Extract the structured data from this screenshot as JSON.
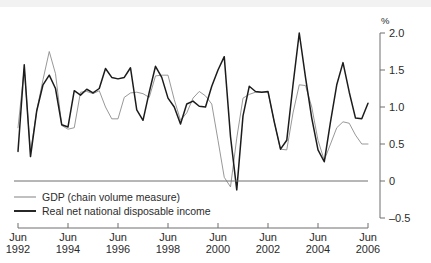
{
  "chart_data": {
    "type": "line",
    "title": "",
    "subtitle": "",
    "xlabel": "",
    "ylabel": "",
    "unit_label": "%",
    "ylim": [
      -0.5,
      2.0
    ],
    "yticks": [
      2.0,
      1.5,
      1.0,
      0.5,
      0.0,
      -0.5
    ],
    "ytick_labels": [
      "2.0",
      "1.5",
      "1.0",
      "0.5",
      "0",
      "–0.5"
    ],
    "grid": false,
    "legend_position": "bottom-left",
    "zero_line": true,
    "x_axis": {
      "frequency": "quarterly",
      "start": "Jun 1992",
      "end": "Jun 2006",
      "tick_labels": [
        {
          "month": "Jun",
          "year": "1992"
        },
        {
          "month": "Jun",
          "year": "1994"
        },
        {
          "month": "Jun",
          "year": "1996"
        },
        {
          "month": "Jun",
          "year": "1998"
        },
        {
          "month": "Jun",
          "year": "2000"
        },
        {
          "month": "Jun",
          "year": "2002"
        },
        {
          "month": "Jun",
          "year": "2004"
        },
        {
          "month": "Jun",
          "year": "2006"
        }
      ],
      "tick_years": [
        1992,
        1994,
        1996,
        1998,
        2000,
        2002,
        2004,
        2006
      ]
    },
    "x": [
      "Jun 1992",
      "Sep 1992",
      "Dec 1992",
      "Mar 1993",
      "Jun 1993",
      "Sep 1993",
      "Dec 1993",
      "Mar 1994",
      "Jun 1994",
      "Sep 1994",
      "Dec 1994",
      "Mar 1995",
      "Jun 1995",
      "Sep 1995",
      "Dec 1995",
      "Mar 1996",
      "Jun 1996",
      "Sep 1996",
      "Dec 1996",
      "Mar 1997",
      "Jun 1997",
      "Sep 1997",
      "Dec 1997",
      "Mar 1998",
      "Jun 1998",
      "Sep 1998",
      "Dec 1998",
      "Mar 1999",
      "Jun 1999",
      "Sep 1999",
      "Dec 1999",
      "Mar 2000",
      "Jun 2000",
      "Sep 2000",
      "Dec 2000",
      "Mar 2001",
      "Jun 2001",
      "Sep 2001",
      "Dec 2001",
      "Mar 2002",
      "Jun 2002",
      "Sep 2002",
      "Dec 2002",
      "Mar 2003",
      "Jun 2003",
      "Sep 2003",
      "Dec 2003",
      "Mar 2004",
      "Jun 2004",
      "Sep 2004",
      "Dec 2004",
      "Mar 2005",
      "Jun 2005",
      "Sep 2005",
      "Dec 2005",
      "Mar 2006",
      "Jun 2006"
    ],
    "series": [
      {
        "name": "GDP (chain volume measure)",
        "color": "#8c8c8c",
        "width": "thin",
        "values": [
          0.72,
          1.52,
          0.39,
          0.95,
          1.37,
          1.75,
          1.45,
          0.75,
          0.7,
          0.72,
          1.2,
          1.21,
          1.18,
          1.22,
          1.0,
          0.84,
          0.84,
          1.13,
          1.19,
          1.2,
          1.18,
          1.13,
          1.42,
          1.43,
          1.43,
          1.1,
          0.82,
          0.92,
          1.12,
          1.21,
          1.15,
          1.04,
          0.55,
          0.05,
          -0.08,
          0.58,
          1.12,
          1.17,
          1.2,
          1.2,
          1.2,
          0.8,
          0.43,
          0.42,
          0.92,
          1.3,
          1.29,
          1.0,
          0.55,
          0.28,
          0.5,
          0.72,
          0.8,
          0.78,
          0.62,
          0.5,
          0.5
        ]
      },
      {
        "name": "Real net national disposable income",
        "color": "#1c1c1c",
        "width": "thick",
        "values": [
          0.4,
          1.57,
          0.33,
          0.95,
          1.3,
          1.43,
          1.25,
          0.76,
          0.73,
          1.22,
          1.16,
          1.24,
          1.19,
          1.25,
          1.52,
          1.4,
          1.38,
          1.4,
          1.53,
          0.96,
          0.82,
          1.2,
          1.55,
          1.4,
          1.12,
          1.0,
          0.77,
          1.04,
          1.08,
          1.01,
          1.0,
          1.28,
          1.5,
          1.68,
          0.6,
          -0.12,
          0.88,
          1.28,
          1.21,
          1.2,
          1.21,
          0.8,
          0.43,
          0.55,
          1.3,
          2.0,
          1.4,
          0.85,
          0.42,
          0.26,
          0.8,
          1.3,
          1.6,
          1.2,
          0.85,
          0.84,
          1.05
        ]
      }
    ],
    "annotations": []
  },
  "legend": {
    "items": [
      {
        "label": "GDP (chain volume measure)",
        "style": "gdp"
      },
      {
        "label": "Real net national disposable income",
        "style": "rnndi"
      }
    ]
  }
}
